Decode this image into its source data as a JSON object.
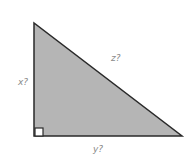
{
  "diagram": {
    "type": "right-triangle",
    "fill_color": "#b5b5b5",
    "stroke_color": "#2a2a2a",
    "labels": {
      "vertical_side": "x?",
      "hypotenuse": "z?",
      "horizontal_side": "y?"
    },
    "right_angle_marker": true
  }
}
